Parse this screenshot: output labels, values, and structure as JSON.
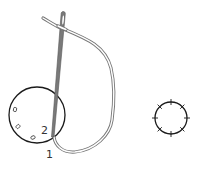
{
  "diagram": {
    "type": "embroidery-stitch-instruction",
    "labels": {
      "point_1": "1",
      "point_2": "2"
    },
    "colors": {
      "circle_stroke": "#1a1a1a",
      "needle_fill": "#7a7a7a",
      "needle_stroke": "#555555",
      "thread_stroke": "#777777",
      "thread_fill": "#ffffff",
      "label_color": "#333333",
      "background": "#ffffff"
    },
    "elements": {
      "left_circle": {
        "cx": 37,
        "cy": 115,
        "r": 28,
        "markers": 3
      },
      "right_circle": {
        "cx": 171,
        "cy": 118,
        "r": 16,
        "ticks": 8
      },
      "needle": {
        "eye": [
          63,
          14
        ],
        "tip": [
          52,
          137
        ]
      }
    }
  }
}
